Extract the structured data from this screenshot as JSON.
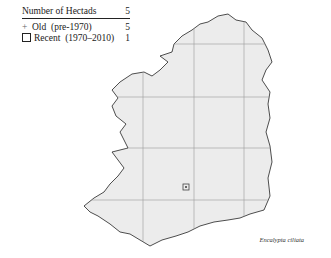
{
  "legend": {
    "title": "Number of Hectads",
    "title_count": "5",
    "items": [
      {
        "symbol": "+",
        "label": "Old  (pre-1970)",
        "count": "5"
      },
      {
        "symbol": "square",
        "label": "Recent  (1970–2010)",
        "count": "1"
      }
    ]
  },
  "map": {
    "region": "Ireland",
    "fill_color": "#ececec",
    "coast_color": "#222222",
    "grid_color": "#9a9a9a",
    "grid_x": [
      143,
      194,
      244
    ],
    "grid_y": [
      44,
      97,
      148,
      200
    ],
    "records": [
      {
        "type": "recent",
        "symbol": "square",
        "x": 186,
        "y": 187
      }
    ]
  },
  "caption": "Encalypta ciliata"
}
